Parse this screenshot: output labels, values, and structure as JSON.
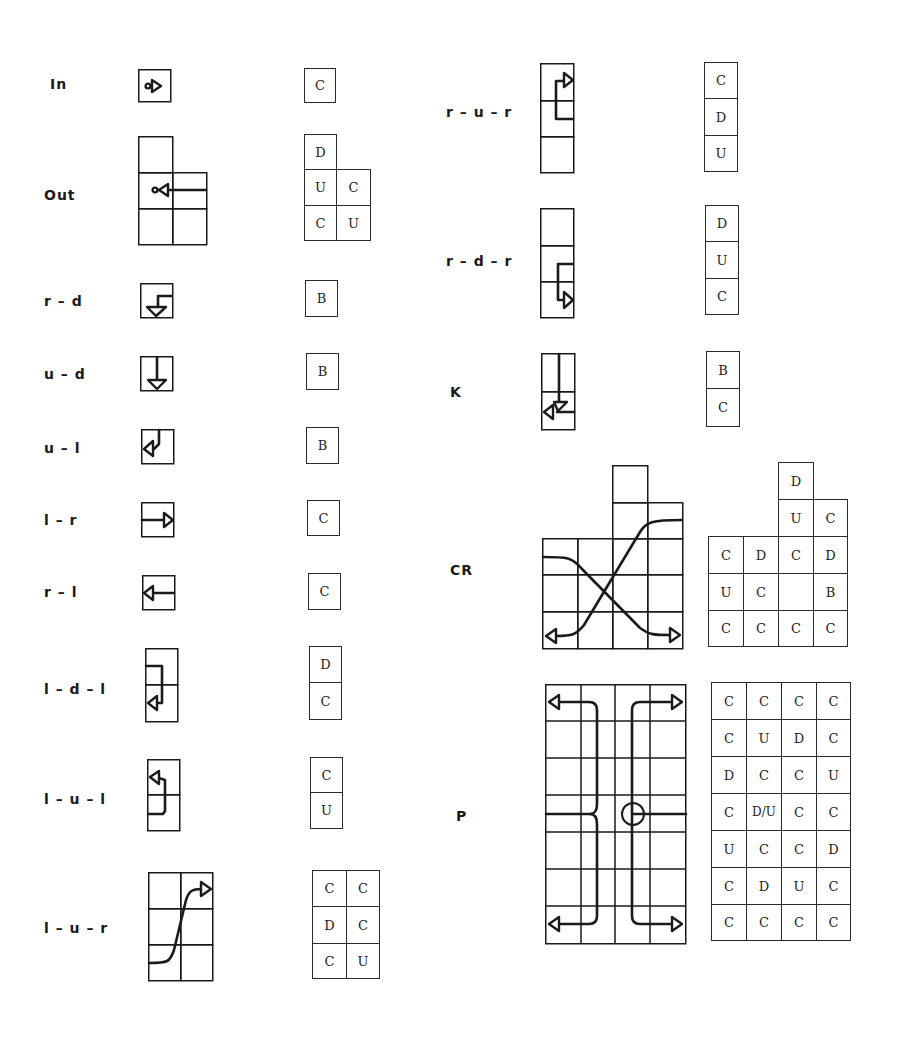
{
  "figure": {
    "rows": [
      {
        "id": "in",
        "label": "In",
        "codes": [
          [
            "C"
          ]
        ]
      },
      {
        "id": "out",
        "label": "Out",
        "codes": [
          [
            "D",
            ""
          ],
          [
            "U",
            "C"
          ],
          [
            "C",
            "U"
          ]
        ]
      },
      {
        "id": "r-d",
        "label": "r – d",
        "codes": [
          [
            "B"
          ]
        ]
      },
      {
        "id": "u-d",
        "label": "u – d",
        "codes": [
          [
            "B"
          ]
        ]
      },
      {
        "id": "u-l",
        "label": "u – l",
        "codes": [
          [
            "B"
          ]
        ]
      },
      {
        "id": "l-r",
        "label": "l – r",
        "codes": [
          [
            "C"
          ]
        ]
      },
      {
        "id": "r-l",
        "label": "r – l",
        "codes": [
          [
            "C"
          ]
        ]
      },
      {
        "id": "l-d-l",
        "label": "l – d – l",
        "codes": [
          [
            "D"
          ],
          [
            "C"
          ]
        ]
      },
      {
        "id": "l-u-l",
        "label": "l – u – l",
        "codes": [
          [
            "C"
          ],
          [
            "U"
          ]
        ]
      },
      {
        "id": "l-u-r",
        "label": "l – u – r",
        "codes": [
          [
            "C",
            "C"
          ],
          [
            "D",
            "C"
          ],
          [
            "C",
            "U"
          ]
        ]
      },
      {
        "id": "r-u-r",
        "label": "r – u – r",
        "codes": [
          [
            "C"
          ],
          [
            "D"
          ],
          [
            "U"
          ]
        ]
      },
      {
        "id": "r-d-r",
        "label": "r – d – r",
        "codes": [
          [
            "D"
          ],
          [
            "U"
          ],
          [
            "C"
          ]
        ]
      },
      {
        "id": "k",
        "label": "K",
        "codes": [
          [
            "B"
          ],
          [
            "C"
          ]
        ]
      },
      {
        "id": "cr",
        "label": "CR",
        "codes": [
          [
            "",
            "",
            "D",
            ""
          ],
          [
            "",
            "",
            "U",
            "C"
          ],
          [
            "C",
            "D",
            "C",
            "D"
          ],
          [
            "U",
            "C",
            "",
            "B"
          ],
          [
            "C",
            "C",
            "C",
            "C"
          ]
        ]
      },
      {
        "id": "p",
        "label": "P",
        "codes": [
          [
            "C",
            "C",
            "C",
            "C"
          ],
          [
            "C",
            "U",
            "D",
            "C"
          ],
          [
            "D",
            "C",
            "C",
            "U"
          ],
          [
            "C",
            "D/U",
            "C",
            "C"
          ],
          [
            "U",
            "C",
            "C",
            "D"
          ],
          [
            "C",
            "D",
            "U",
            "C"
          ],
          [
            "C",
            "C",
            "C",
            "C"
          ]
        ]
      }
    ]
  }
}
